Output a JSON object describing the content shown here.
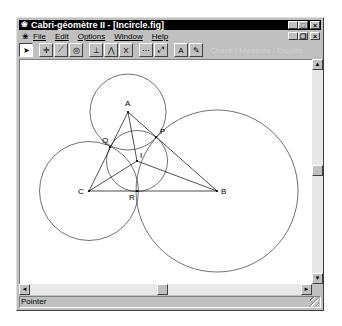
{
  "window": {
    "title": "Cabri-géomètre II - [Incircle.fig]",
    "app_icon": "cabri-app-icon",
    "controls": {
      "minimize": "_",
      "maximize": "□",
      "close": "×"
    },
    "doc_controls": {
      "minimize": "_",
      "restore": "❐",
      "close": "×"
    }
  },
  "menubar": {
    "items": [
      {
        "label": "File"
      },
      {
        "label": "Edit"
      },
      {
        "label": "Options"
      },
      {
        "label": "Window"
      },
      {
        "label": "Help"
      }
    ]
  },
  "toolbar": {
    "tools": [
      {
        "name": "pointer-tool",
        "glyph": "➤",
        "pressed": true
      },
      {
        "name": "points-tool",
        "glyph": "✛"
      },
      {
        "name": "lines-tool",
        "glyph": "⟋"
      },
      {
        "name": "curves-tool",
        "glyph": "◎"
      },
      {
        "name": "construct-tool",
        "glyph": "⊥"
      },
      {
        "name": "transform-tool",
        "glyph": "⋀"
      },
      {
        "name": "macro-tool",
        "glyph": "X"
      },
      {
        "name": "check-property-tool",
        "glyph": "⋯"
      },
      {
        "name": "measure-tool",
        "glyph": "⤢"
      },
      {
        "name": "display-tool",
        "glyph": "A"
      },
      {
        "name": "draw-tool",
        "glyph": "✎"
      }
    ],
    "ghost_text": "Check / Measure / Display"
  },
  "figure": {
    "points": [
      {
        "label": "A",
        "x": 108,
        "y": 52
      },
      {
        "label": "B",
        "x": 197,
        "y": 131
      },
      {
        "label": "C",
        "x": 69,
        "y": 131
      },
      {
        "label": "I",
        "x": 117,
        "y": 101
      },
      {
        "label": "P",
        "x": 136,
        "y": 77
      },
      {
        "label": "Q",
        "x": 90,
        "y": 87
      },
      {
        "label": "R",
        "x": 117,
        "y": 131
      }
    ],
    "circles": [
      {
        "name": "circle-A",
        "cx": 108,
        "cy": 52,
        "r": 38
      },
      {
        "name": "circle-B",
        "cx": 197,
        "cy": 131,
        "r": 81
      },
      {
        "name": "circle-C",
        "cx": 69,
        "cy": 131,
        "r": 49.5
      },
      {
        "name": "incircle",
        "cx": 117,
        "cy": 101,
        "r": 30.5
      }
    ]
  },
  "scrollbars": {
    "vertical": {
      "up": "▲",
      "down": "▼"
    },
    "horizontal": {
      "left": "◄",
      "right": "►"
    }
  },
  "status": {
    "text": "Pointer"
  }
}
